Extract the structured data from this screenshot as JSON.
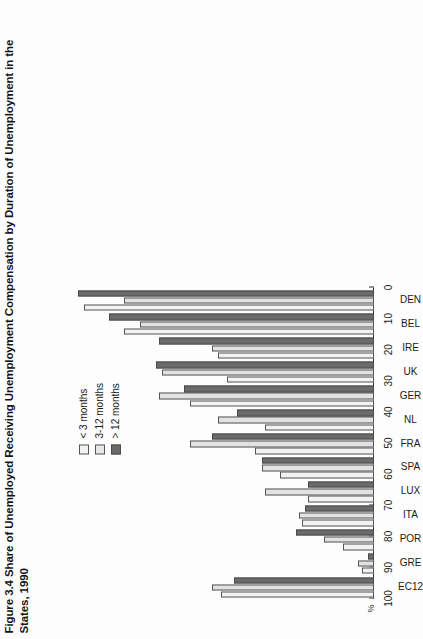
{
  "figure": {
    "title_line1": "Figure 3.4  Share of Unemployed Receiving Unemployment Compensation by Duration of Unemployment in the",
    "title_line2": "States, 1990"
  },
  "axis": {
    "unit_label": "%",
    "ticks": [
      "100",
      "90",
      "80",
      "70",
      "60",
      "50",
      "40",
      "30",
      "20",
      "10",
      "0"
    ]
  },
  "legend": {
    "items": [
      {
        "label": "< 3 months",
        "color": "#f2f2f2"
      },
      {
        "label": "3-12 months",
        "color": "#e7e7e7"
      },
      {
        "label": "> 12 months",
        "color": "#6b6b6b"
      }
    ]
  },
  "chart_data": {
    "type": "bar",
    "title": "Figure 3.4  Share of Unemployed Receiving Unemployment Compensation by Duration of Unemployment in the States, 1990",
    "xlabel": "",
    "ylabel": "%",
    "ylim": [
      0,
      100
    ],
    "grid": false,
    "legend_position": "top-left",
    "orientation": "vertical-rotated",
    "categories": [
      "DEN",
      "BEL",
      "IRE",
      "UK",
      "GER",
      "NL",
      "FRA",
      "SPA",
      "LUX",
      "ITA",
      "POR",
      "GRE",
      "EC12"
    ],
    "series": [
      {
        "name": "< 3 months",
        "color": "#f2f2f2",
        "values": [
          93,
          80,
          50,
          47,
          59,
          35,
          38,
          30,
          21,
          23,
          10,
          4,
          49
        ]
      },
      {
        "name": "3-12 months",
        "color": "#e7e7e7",
        "values": [
          80,
          75,
          52,
          68,
          69,
          50,
          59,
          36,
          35,
          24,
          16,
          5,
          52
        ]
      },
      {
        "name": "> 12 months",
        "color": "#6b6b6b",
        "values": [
          95,
          85,
          69,
          70,
          61,
          44,
          52,
          36,
          21,
          22,
          25,
          2,
          45
        ]
      }
    ]
  }
}
